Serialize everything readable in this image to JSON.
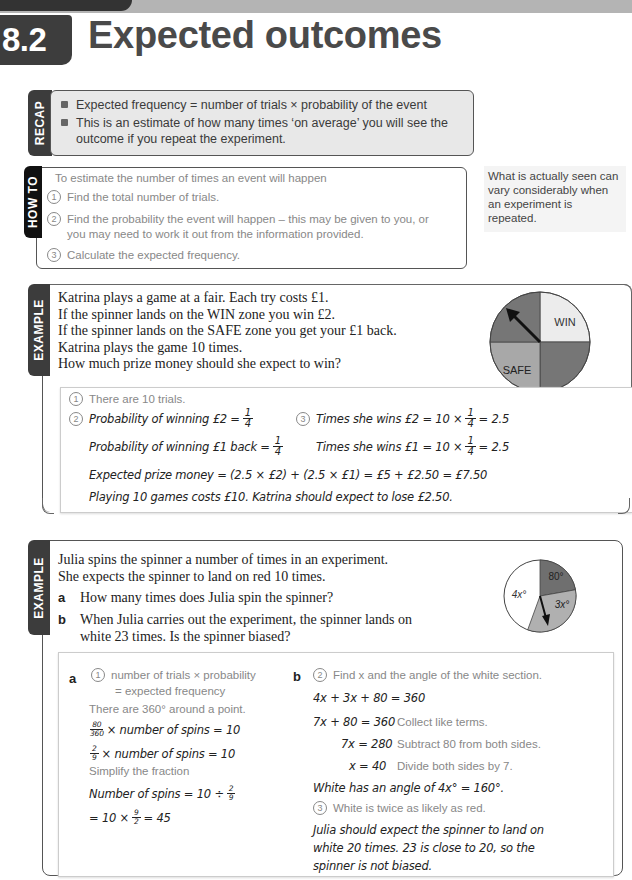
{
  "header": {
    "section_number": "8.2",
    "title": "Expected outcomes"
  },
  "recap": {
    "tab_label": "RECAP",
    "bullets": [
      "Expected frequency = number of trials × probability of the event",
      "This is an estimate of how many times ‘on average’ you will see the",
      "outcome if you repeat the experiment."
    ]
  },
  "howto": {
    "tab_label": "HOW TO",
    "intro": "To estimate the number of times an event will happen",
    "steps": [
      {
        "num": "1",
        "text": "Find the total number of trials."
      },
      {
        "num": "2",
        "text": "Find the probability the event will happen – this may be given to you, or",
        "text2": "you may need to work it out from the information provided."
      },
      {
        "num": "3",
        "text": "Calculate the expected frequency."
      }
    ]
  },
  "sidenote": {
    "text": "What is actually seen can vary considerably when an experiment is repeated."
  },
  "example1": {
    "tab_label": "EXAMPLE",
    "question_lines": [
      "Katrina plays a game at a fair. Each try costs £1.",
      "If the spinner lands on the WIN zone you win £2.",
      "If the spinner lands on the SAFE zone you get your £1 back.",
      "Katrina plays the game 10 times.",
      "How much prize money should she expect to win?"
    ],
    "spinner": {
      "labels": [
        "WIN",
        "SAFE"
      ],
      "colors": {
        "win": "#eeeeee",
        "safe": "#a9a9a9",
        "dark": "#7a7a7a"
      }
    },
    "solution": {
      "step1_num": "1",
      "step1": "There are 10 trials.",
      "step2_num": "2",
      "step2a": "Probability of winning £2 =",
      "step2b": "Probability of winning £1 back =",
      "step3_num": "3",
      "step3a": "Times she wins £2 = 10 ×",
      "step3a_result": "= 2.5",
      "step3b": "Times she wins £1 = 10 ×",
      "step3b_result": "= 2.5",
      "frac_num": "1",
      "frac_den": "4",
      "expected": "Expected prize money = (2.5 × £2) + (2.5 × £1) = £5 + £2.50 = £7.50",
      "conclusion": "Playing 10 games costs £10. Katrina should expect to lose £2.50."
    }
  },
  "example2": {
    "tab_label": "EXAMPLE",
    "question_lines": [
      "Julia spins the spinner a number of times in an experiment.",
      "She expects the spinner to land on red 10 times."
    ],
    "parts": [
      {
        "label": "a",
        "text": "How many times does Julia spin the spinner?"
      },
      {
        "label": "b",
        "text": "When Julia carries out the experiment, the spinner lands on",
        "text2": "white 23 times. Is the spinner biased?"
      }
    ],
    "spinner": {
      "labels": [
        "80°",
        "4x°",
        "3x°"
      ],
      "colors": {
        "red": "#6f6f6f",
        "white": "#ffffff",
        "gray": "#b0b0b0"
      }
    },
    "solution_a": {
      "label": "a",
      "step1_num": "1",
      "step1_line1": "number of trials × probability",
      "step1_line2": "= expected frequency",
      "note1": "There are 360° around a point.",
      "eq1_frac_num": "80",
      "eq1_frac_den": "360",
      "eq1_rest": "× number of spins = 10",
      "eq2_frac_num": "2",
      "eq2_frac_den": "9",
      "eq2_rest": "× number of spins = 10",
      "note2": "Simplify the fraction",
      "eq3": "Number of spins = 10 ÷",
      "eq3_frac_num": "2",
      "eq3_frac_den": "9",
      "eq4a": "= 10 ×",
      "eq4_frac_num": "9",
      "eq4_frac_den": "2",
      "eq4b": "= 45"
    },
    "solution_b": {
      "label": "b",
      "step2_num": "2",
      "step2": "Find x and the angle of the white section.",
      "eq1": "4x + 3x + 80 = 360",
      "eq2": "7x + 80 = 360",
      "eq2_note": "Collect like terms.",
      "eq3": "7x = 280",
      "eq3_note": "Subtract 80 from both sides.",
      "eq4": "x = 40",
      "eq4_note": "Divide both sides by 7.",
      "white_angle": "White has an angle of 4x° = 160°.",
      "step3_num": "3",
      "step3": "White is twice as likely as red.",
      "conclusion_lines": [
        "Julia should expect the spinner to land on",
        "white 20 times. 23 is close to 20, so the",
        "spinner is not biased."
      ]
    }
  }
}
